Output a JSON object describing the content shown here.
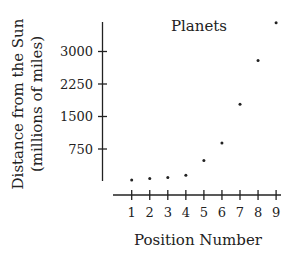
{
  "chart_data": {
    "type": "scatter",
    "title": "Planets",
    "xlabel": "Position Number",
    "ylabel": [
      "Distance from the Sun",
      "(millions of miles)"
    ],
    "x": [
      1,
      2,
      3,
      4,
      5,
      6,
      7,
      8,
      9
    ],
    "y": [
      36,
      67,
      93,
      142,
      484,
      887,
      1784,
      2794,
      3666
    ],
    "x_ticks": [
      "1",
      "2",
      "3",
      "4",
      "5",
      "6",
      "7",
      "8",
      "9"
    ],
    "y_ticks": [
      {
        "value": 750,
        "label": "750"
      },
      {
        "value": 1500,
        "label": "1500"
      },
      {
        "value": 2250,
        "label": "2250"
      },
      {
        "value": 3000,
        "label": "3000"
      }
    ],
    "ylim": [
      0,
      3700
    ],
    "xlim": [
      0.2,
      9.2
    ],
    "grid": false,
    "legend": null,
    "colors": {
      "ink": "#222222",
      "background": "#ffffff"
    }
  }
}
